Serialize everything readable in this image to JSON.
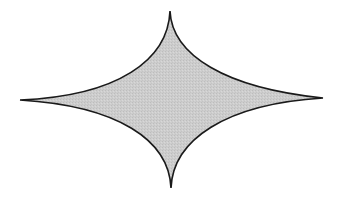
{
  "diagram": {
    "shape": "astroid",
    "tips": {
      "top": [
        170,
        11
      ],
      "right": [
        323,
        98
      ],
      "bottom": [
        171,
        188
      ],
      "left": [
        20,
        100
      ]
    },
    "center": [
      171,
      99
    ],
    "fill_color": "#cbcbcb",
    "stroke_color": "#1a1a1a",
    "background_color": "#ffffff"
  }
}
